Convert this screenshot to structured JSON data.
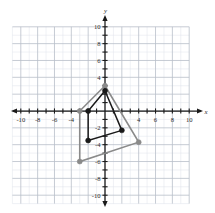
{
  "figure": {
    "title": "",
    "background_color": "#ffffff"
  },
  "chart_data": {
    "type": "scatter",
    "title": "",
    "xlabel": "x",
    "ylabel": "y",
    "xlim": [
      -11,
      11
    ],
    "ylim": [
      -11,
      11
    ],
    "grid": true,
    "minor_grid_step": 1,
    "major_grid_step": 2,
    "legend_position": "none",
    "x_tick_labels": [
      "-10",
      "-8",
      "-6",
      "-4",
      "4",
      "6",
      "8",
      "10"
    ],
    "x_tick_values": [
      -10,
      -8,
      -6,
      -4,
      4,
      6,
      8,
      10
    ],
    "y_tick_labels": [
      "10",
      "8",
      "6",
      "4",
      "-2",
      "-4",
      "-6",
      "-8",
      "-10"
    ],
    "y_tick_values": [
      10,
      8,
      6,
      4,
      -2,
      -4,
      -6,
      -8,
      -10
    ],
    "series": [
      {
        "name": "image-quadrilateral",
        "shape": "quadrilateral",
        "color": "#8a8a8a",
        "closed": true,
        "marker": "circle",
        "points": [
          {
            "x": 0,
            "y": 3
          },
          {
            "x": 4,
            "y": -3.7
          },
          {
            "x": -3,
            "y": -6
          },
          {
            "x": -3,
            "y": 0
          }
        ]
      },
      {
        "name": "preimage-quadrilateral",
        "shape": "quadrilateral",
        "color": "#1a1a1a",
        "closed": true,
        "marker": "circle",
        "points": [
          {
            "x": 0,
            "y": 2.4
          },
          {
            "x": 2,
            "y": -2.3
          },
          {
            "x": -2,
            "y": -3.5
          },
          {
            "x": -2,
            "y": 0
          }
        ]
      }
    ]
  }
}
